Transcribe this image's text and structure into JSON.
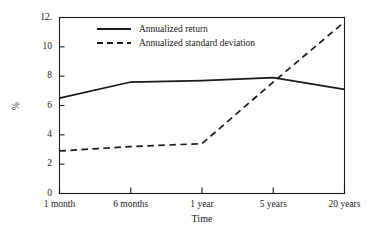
{
  "chart_data": {
    "type": "line",
    "title": "",
    "subtitle": "",
    "xlabel": "Time",
    "ylabel": "%",
    "categories": [
      "1 month",
      "6 months",
      "1 year",
      "5 years",
      "20 years"
    ],
    "series": [
      {
        "name": "Annualized return",
        "style": "solid",
        "color": "#1a1a1a",
        "values": [
          6.5,
          7.6,
          7.7,
          7.9,
          7.1
        ]
      },
      {
        "name": "Annualized standard deviation",
        "style": "dashed",
        "color": "#1a1a1a",
        "values": [
          2.9,
          3.2,
          3.4,
          7.6,
          11.7
        ]
      }
    ],
    "ylim": [
      0,
      12
    ],
    "yticks": [
      0,
      2,
      4,
      6,
      8,
      10,
      12
    ],
    "ytick_labels": [
      "0",
      "2",
      "4",
      "6",
      "8",
      "10",
      "12."
    ],
    "grid": false,
    "legend_position": "top-center"
  },
  "axes": {
    "y_title": "%",
    "x_title": "Time"
  },
  "legend": {
    "entries": [
      {
        "label": "Annualized return"
      },
      {
        "label": "Annualized standard deviation"
      }
    ]
  },
  "icons": {
    "solid_line": "solid-line-icon",
    "dashed_line": "dashed-line-icon"
  },
  "colors": {
    "background": "#ffffff",
    "axis": "#1a1a1a",
    "series": "#1a1a1a"
  }
}
